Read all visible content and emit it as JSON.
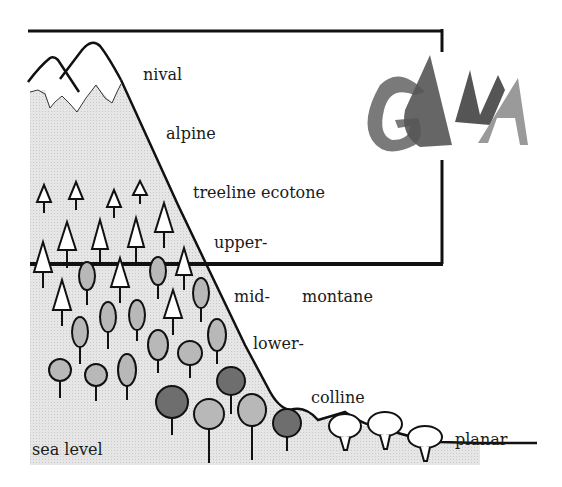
{
  "diagram": {
    "logo": {
      "text": "GBMA",
      "letters": [
        "G",
        "B",
        "M",
        "A"
      ],
      "colors": {
        "dark": "#555555",
        "mid": "#7a7a7a",
        "light": "#9a9a9a"
      }
    },
    "labels": {
      "nival": "nival",
      "alpine": "alpine",
      "treeline": "treeline ecotone",
      "upper": "upper-",
      "mid": "mid-",
      "montane": "montane",
      "lower": "lower-",
      "colline": "colline",
      "planar": "planar",
      "sea_level": "sea level"
    },
    "colors": {
      "ink": "#111111",
      "ground_fill": "#e2e2e2",
      "tree_light": "#b8b8b8",
      "tree_dark": "#6e6e6e",
      "conifer_fill": "#ffffff"
    },
    "belts": [
      "nival",
      "alpine",
      "treeline ecotone",
      "upper-montane",
      "mid-montane",
      "lower-montane",
      "colline",
      "planar"
    ]
  }
}
